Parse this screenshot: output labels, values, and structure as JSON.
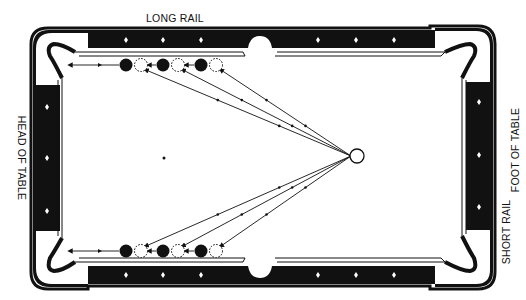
{
  "labels": {
    "top": "LONG RAIL",
    "left": "HEAD OF TABLE",
    "right_outer": "FOOT OF TABLE",
    "right_inner": "SHORT RAIL"
  },
  "colors": {
    "rail": "#111111",
    "cloth": "#ffffff",
    "ink": "#111111"
  },
  "diagram": {
    "diamonds_per_long_rail_segment": 3,
    "diamonds_per_short_rail": 3,
    "object_balls_per_rail": 3,
    "ghost_balls_per_rail": 3,
    "cue_ball": "cue-ball",
    "head_spot": "head-spot"
  }
}
